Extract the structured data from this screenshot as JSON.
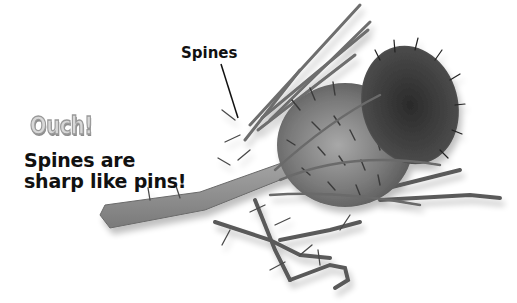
{
  "heading": {
    "exclamation": "Ouch!",
    "caption_line1": "Spines are",
    "caption_line2": "sharp like pins!"
  },
  "labels": {
    "spines": "Spines"
  },
  "illustration": {
    "subject": "thistle-plant",
    "palette": {
      "stem": "#8a8a8a",
      "head": "#6a6a6a",
      "flower": "#3c3c3c",
      "spine": "#4a4a4a",
      "leader_line": "#111111"
    }
  }
}
